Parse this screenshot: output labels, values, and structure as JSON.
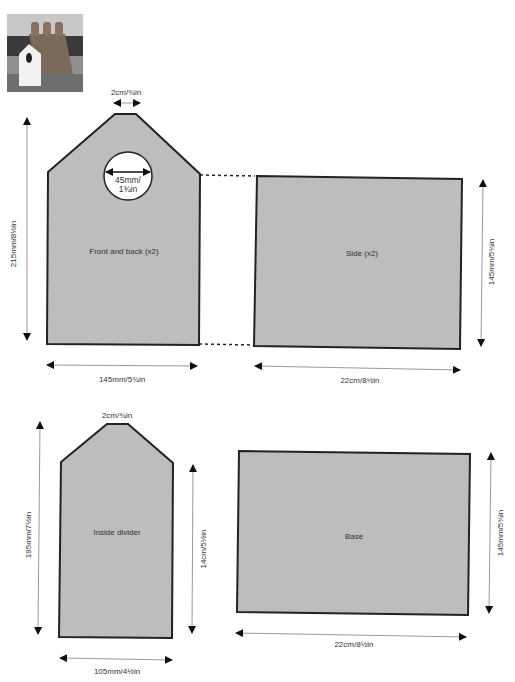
{
  "photo": {
    "alt": "birdhouse-photo"
  },
  "colors": {
    "panel_fill": "#bdbdbd",
    "panel_stroke": "#222222",
    "dim_line": "#999999",
    "arrow": "#111111",
    "text": "#333333"
  },
  "pieces": {
    "front_back": {
      "label": "Front and back (x2)",
      "top_width": "2cm/¾in",
      "hole_line1": "45mm/",
      "hole_line2": "1¾in",
      "height": "215mm/8½in",
      "width": "145mm/5¾in"
    },
    "side": {
      "label": "Side (x2)",
      "height": "145mm/5¾in",
      "width": "22cm/8½in"
    },
    "inside_divider": {
      "label": "Inside divider",
      "top_width": "2cm/¾in",
      "height": "195mm/7½in",
      "side_height": "14cm/5½in",
      "width": "105mm/4½in"
    },
    "base": {
      "label": "Base",
      "height": "145mm/5¾in",
      "width": "22cm/8½in"
    }
  }
}
